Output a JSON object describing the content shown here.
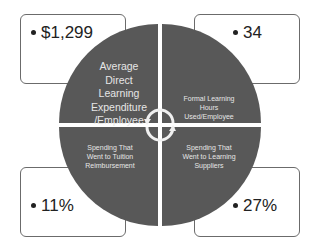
{
  "diagram": {
    "quadrants": [
      {
        "position": "top-left",
        "label": "Average Direct Learning Expenditure /Employee",
        "label_lines": [
          "Average",
          "Direct",
          "Learning",
          "Expenditure",
          "/Employee"
        ],
        "value": "$1,299"
      },
      {
        "position": "top-right",
        "label": "Formal Learning Hours Used/Employee",
        "label_lines": [
          "Formal Learning",
          "Hours",
          "Used/Employee"
        ],
        "value": "34"
      },
      {
        "position": "bottom-left",
        "label": "Spending That Went to Tuition Reimbursement",
        "label_lines": [
          "Spending That",
          "Went to Tuition",
          "Reimbursement"
        ],
        "value": "11%"
      },
      {
        "position": "bottom-right",
        "label": "Spending That Went to Learning Suppliers",
        "label_lines": [
          "Spending That",
          "Went to Learning",
          "Suppliers"
        ],
        "value": "27%"
      }
    ],
    "center_icon": "cycle-arrows-icon",
    "colors": {
      "quadrant_fill": "#585858",
      "quadrant_text": "#e6e6e6",
      "box_border": "#6b6b6b",
      "value_text": "#222222"
    }
  }
}
